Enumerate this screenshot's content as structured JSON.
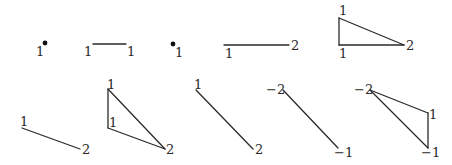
{
  "figure": {
    "colors": {
      "stroke": "#2a2a2a",
      "background": "#ffffff"
    },
    "diagrams": [
      {
        "id": "d1",
        "type": "point",
        "vertices": [
          {
            "x": 45,
            "y": 43,
            "label": "1",
            "lx": 36,
            "ly": 56,
            "dot": true
          }
        ],
        "edges": []
      },
      {
        "id": "d2",
        "type": "segment",
        "vertices": [
          {
            "x": 93,
            "y": 44,
            "label": "1",
            "lx": 84,
            "ly": 56
          },
          {
            "x": 126,
            "y": 44,
            "label": "1",
            "lx": 127,
            "ly": 56
          }
        ],
        "edges": [
          [
            0,
            1
          ]
        ]
      },
      {
        "id": "d3",
        "type": "point",
        "vertices": [
          {
            "x": 173,
            "y": 44,
            "label": "1",
            "lx": 175,
            "ly": 57,
            "dot": true
          }
        ],
        "edges": []
      },
      {
        "id": "d4",
        "type": "segment",
        "vertices": [
          {
            "x": 224,
            "y": 45,
            "label": "1",
            "lx": 225,
            "ly": 58
          },
          {
            "x": 289,
            "y": 45,
            "label": "2",
            "lx": 291,
            "ly": 50
          }
        ],
        "edges": [
          [
            0,
            1
          ]
        ]
      },
      {
        "id": "d5",
        "type": "triangle",
        "vertices": [
          {
            "x": 339,
            "y": 18,
            "label": "1",
            "lx": 339,
            "ly": 15
          },
          {
            "x": 339,
            "y": 45,
            "label": "1",
            "lx": 339,
            "ly": 58
          },
          {
            "x": 404,
            "y": 45,
            "label": "2",
            "lx": 406,
            "ly": 50
          }
        ],
        "edges": [
          [
            0,
            1
          ],
          [
            1,
            2
          ],
          [
            0,
            2
          ]
        ]
      },
      {
        "id": "d6",
        "type": "segment",
        "vertices": [
          {
            "x": 22,
            "y": 128,
            "label": "1",
            "lx": 20,
            "ly": 126
          },
          {
            "x": 80,
            "y": 149,
            "label": "2",
            "lx": 82,
            "ly": 154
          }
        ],
        "edges": [
          [
            0,
            1
          ]
        ]
      },
      {
        "id": "d7",
        "type": "triangle",
        "vertices": [
          {
            "x": 108,
            "y": 89,
            "label": "1",
            "lx": 107,
            "ly": 89
          },
          {
            "x": 108,
            "y": 128,
            "label": "1",
            "lx": 109,
            "ly": 127
          },
          {
            "x": 165,
            "y": 149,
            "label": "2",
            "lx": 166,
            "ly": 154
          }
        ],
        "edges": [
          [
            0,
            1
          ],
          [
            1,
            2
          ],
          [
            0,
            2
          ]
        ]
      },
      {
        "id": "d8",
        "type": "segment",
        "vertices": [
          {
            "x": 196,
            "y": 90,
            "label": "1",
            "lx": 194,
            "ly": 89
          },
          {
            "x": 253,
            "y": 149,
            "label": "2",
            "lx": 255,
            "ly": 154
          }
        ],
        "edges": [
          [
            0,
            1
          ]
        ]
      },
      {
        "id": "d9",
        "type": "segment",
        "vertices": [
          {
            "x": 283,
            "y": 90,
            "label": "−2",
            "lx": 266,
            "ly": 94
          },
          {
            "x": 338,
            "y": 148,
            "label": "−1",
            "lx": 334,
            "ly": 157
          }
        ],
        "edges": [
          [
            0,
            1
          ]
        ]
      },
      {
        "id": "d10",
        "type": "triangle",
        "vertices": [
          {
            "x": 370,
            "y": 90,
            "label": "−2",
            "lx": 354,
            "ly": 94
          },
          {
            "x": 428,
            "y": 113,
            "label": "1",
            "lx": 429,
            "ly": 119
          },
          {
            "x": 428,
            "y": 148,
            "label": "−1",
            "lx": 421,
            "ly": 157
          }
        ],
        "edges": [
          [
            0,
            1
          ],
          [
            1,
            2
          ],
          [
            0,
            2
          ]
        ]
      }
    ]
  }
}
